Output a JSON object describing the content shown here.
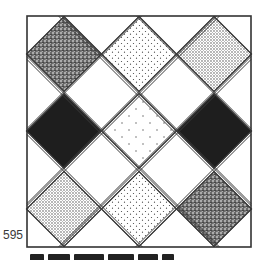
{
  "figure": {
    "type": "quilt-block-diagram",
    "page_number": "595",
    "frame": {
      "x": 27,
      "y": 16,
      "width": 224,
      "height": 231,
      "stroke": "#333333"
    },
    "diamond_half_size": 37.5,
    "columns_x": [
      64,
      139,
      214
    ],
    "rows_y": [
      54,
      131,
      209
    ],
    "fills": {
      "dense": "dense-stipple",
      "light": "light-dots",
      "medium": "medium-dots",
      "solid": "solid-black",
      "sparse": "sparse-dots"
    },
    "grid": [
      [
        "dense",
        "light",
        "medium"
      ],
      [
        "solid",
        "sparse",
        "solid"
      ],
      [
        "medium",
        "light",
        "dense"
      ]
    ],
    "colors": {
      "ink": "#1e1e1e",
      "line": "#3a3a3a",
      "paper": "#ffffff"
    }
  }
}
